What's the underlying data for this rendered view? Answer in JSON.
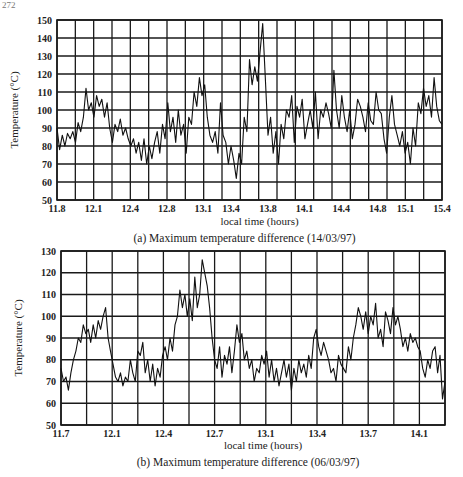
{
  "page_number": "272",
  "chart_data": [
    {
      "type": "line",
      "caption": "(a) Maximum temperature difference (14/03/97)",
      "xlabel": "local time (hours)",
      "ylabel": "Temperature (°C)",
      "ylim": [
        50,
        150
      ],
      "yticks": [
        50,
        60,
        70,
        80,
        90,
        100,
        110,
        120,
        130,
        140,
        150
      ],
      "xlim": [
        11.8,
        15.4
      ],
      "grid": true,
      "vertical_grid_intervals": 21,
      "xtick_labels": [
        "11.8",
        "12.1",
        "12.4",
        "12.8",
        "13.1",
        "13.4",
        "13.8",
        "14.1",
        "14.4",
        "14.8",
        "15.1",
        "15.4"
      ],
      "xtick_fractions": [
        0,
        0.095,
        0.19,
        0.285,
        0.38,
        0.452,
        0.548,
        0.643,
        0.738,
        0.833,
        0.905,
        1.0
      ],
      "series": [
        {
          "name": "max temperature difference",
          "x_fraction": [
            0,
            0.01,
            0.02,
            0.03,
            0.04,
            0.05,
            0.06,
            0.07,
            0.08,
            0.09,
            0.1,
            0.11,
            0.12,
            0.13,
            0.14,
            0.15,
            0.16,
            0.17,
            0.18,
            0.19,
            0.2,
            0.21,
            0.22,
            0.23,
            0.24,
            0.25,
            0.26,
            0.27,
            0.28,
            0.29,
            0.3,
            0.31,
            0.32,
            0.33,
            0.34,
            0.35,
            0.36,
            0.37,
            0.38,
            0.39,
            0.4,
            0.41,
            0.42,
            0.43,
            0.44,
            0.45,
            0.46,
            0.47,
            0.48,
            0.49,
            0.5,
            0.51,
            0.52,
            0.53,
            0.54,
            0.55,
            0.56,
            0.57,
            0.58,
            0.59,
            0.6,
            0.61,
            0.62,
            0.63,
            0.64,
            0.65,
            0.66,
            0.67,
            0.68,
            0.69,
            0.7,
            0.71,
            0.72,
            0.73,
            0.74,
            0.75,
            0.76,
            0.77,
            0.78,
            0.79,
            0.8,
            0.81,
            0.82,
            0.83,
            0.84,
            0.85,
            0.86,
            0.87,
            0.88,
            0.89,
            0.9,
            0.91,
            0.92,
            0.93,
            0.94,
            0.95,
            0.96,
            0.97,
            0.98,
            0.99,
            1.0
          ],
          "values": [
            90,
            78,
            86,
            80,
            87,
            84,
            88,
            82,
            93,
            88,
            96,
            112,
            100,
            104,
            96,
            108,
            102,
            106,
            96,
            104,
            90,
            82,
            92,
            88,
            95,
            86,
            90,
            84,
            80,
            84,
            76,
            82,
            72,
            84,
            70,
            80,
            73,
            82,
            88,
            76,
            92,
            84,
            104,
            88,
            96,
            82,
            100,
            86,
            92,
            76,
            96,
            92,
            110,
            102,
            118,
            108,
            114,
            96,
            86,
            82,
            88,
            76,
            104,
            86,
            82,
            70,
            80,
            72,
            62,
            76,
            70,
            96,
            88,
            128,
            114,
            124,
            116,
            132,
            148,
            118,
            86,
            96,
            76,
            88,
            70,
            92,
            84,
            100,
            96,
            108,
            82,
            102,
            96,
            106,
            84,
            92,
            100,
            90,
            110,
            84,
            100,
            96,
            104,
            98,
            90,
            122,
            100,
            90,
            108,
            96,
            88,
            100,
            84,
            92,
            106,
            102,
            96,
            88,
            104,
            94,
            92,
            110,
            100,
            98,
            84,
            76,
            96,
            108,
            92,
            86,
            80,
            88,
            76,
            82,
            70,
            90,
            80,
            104,
            98,
            112,
            102,
            108,
            96,
            118,
            102,
            94,
            92
          ]
        }
      ]
    },
    {
      "type": "line",
      "caption": "(b) Maximum temperature difference (06/03/97)",
      "xlabel": "local time (hours)",
      "ylabel": "Temperature (°C)",
      "ylim": [
        50,
        130
      ],
      "yticks": [
        50,
        60,
        70,
        80,
        90,
        100,
        110,
        120,
        130
      ],
      "xlim": [
        11.7,
        14.2
      ],
      "grid": true,
      "vertical_grid_intervals": 15,
      "xtick_labels": [
        "11.7",
        "12.1",
        "12.4",
        "12.7",
        "13.1",
        "13.4",
        "13.7",
        "14.1"
      ],
      "xtick_fractions": [
        0,
        0.133,
        0.267,
        0.4,
        0.533,
        0.667,
        0.8,
        0.933
      ],
      "series": [
        {
          "name": "max temperature difference",
          "values": [
            76,
            70,
            72,
            66,
            74,
            80,
            84,
            90,
            88,
            96,
            92,
            94,
            88,
            96,
            90,
            98,
            94,
            100,
            104,
            90,
            84,
            78,
            72,
            70,
            74,
            68,
            72,
            70,
            80,
            74,
            70,
            84,
            82,
            88,
            74,
            80,
            70,
            78,
            68,
            76,
            72,
            82,
            86,
            80,
            90,
            84,
            96,
            100,
            112,
            104,
            110,
            100,
            108,
            98,
            118,
            104,
            110,
            126,
            120,
            114,
            104,
            90,
            80,
            76,
            86,
            72,
            82,
            78,
            86,
            74,
            84,
            96,
            88,
            92,
            80,
            84,
            76,
            80,
            70,
            76,
            74,
            82,
            78,
            84,
            72,
            80,
            70,
            76,
            68,
            74,
            80,
            72,
            78,
            66,
            76,
            70,
            80,
            74,
            78,
            72,
            82,
            76,
            90,
            94,
            86,
            82,
            88,
            84,
            80,
            74,
            76,
            70,
            82,
            78,
            76,
            74,
            86,
            80,
            90,
            96,
            104,
            100,
            94,
            102,
            92,
            100,
            96,
            106,
            90,
            94,
            86,
            102,
            98,
            92,
            104,
            96,
            100,
            94,
            86,
            90,
            84,
            92,
            88,
            90,
            86,
            84,
            76,
            72,
            80,
            76,
            84,
            86,
            74,
            82,
            62,
            70
          ]
        }
      ]
    }
  ]
}
